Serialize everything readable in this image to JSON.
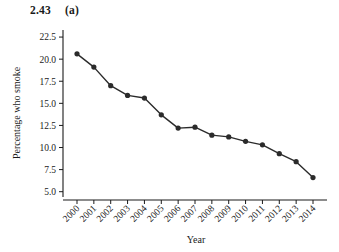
{
  "header": {
    "exercise_number": "2.43",
    "part_label": "(a)"
  },
  "chart_data": {
    "type": "line",
    "title": "",
    "xlabel": "Year",
    "ylabel": "Percentage who smoke",
    "categories": [
      "2000",
      "2001",
      "2002",
      "2003",
      "2004",
      "2005",
      "2006",
      "2007",
      "2008",
      "2009",
      "2010",
      "2011",
      "2012",
      "2013",
      "2014"
    ],
    "values": [
      20.6,
      19.1,
      17.0,
      15.9,
      15.6,
      13.7,
      12.2,
      12.3,
      11.4,
      11.2,
      10.7,
      10.3,
      9.3,
      8.4,
      6.6
    ],
    "ylim": [
      4.4,
      23.3
    ],
    "yticks": [
      "22.5",
      "20.0",
      "17.5",
      "15.0",
      "12.5",
      "10.0",
      "7.5",
      "5.0"
    ],
    "ytick_values": [
      22.5,
      20.0,
      17.5,
      15.0,
      12.5,
      10.0,
      7.5,
      5.0
    ],
    "grid": false,
    "legend": "none",
    "marker": "filled-circle",
    "line_color": "#2b2b2b",
    "marker_color": "#2b2b2b",
    "xtick_rotation": 45
  }
}
